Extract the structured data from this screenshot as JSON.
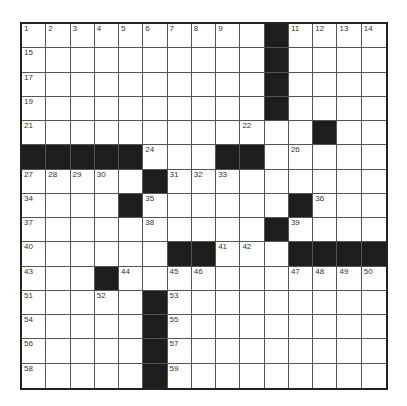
{
  "puzzle": {
    "rows": 15,
    "cols": 15,
    "colors": {
      "black": "#1e1e1e",
      "white": "#ffffff",
      "line": "#555555"
    },
    "grid": [
      "..........#....",
      "..........#....",
      "..........#....",
      "..........#....",
      "............#..",
      "#####...##.....",
      ".....#.........",
      "....#......#...",
      "..........#....",
      "......##...####",
      "...#...........",
      ".....#.........",
      ".....#.........",
      ".....#.........",
      ".....#........."
    ],
    "numbers": [
      {
        "r": 0,
        "c": 0,
        "n": "1"
      },
      {
        "r": 0,
        "c": 1,
        "n": "2"
      },
      {
        "r": 0,
        "c": 2,
        "n": "3"
      },
      {
        "r": 0,
        "c": 3,
        "n": "4"
      },
      {
        "r": 0,
        "c": 4,
        "n": "5"
      },
      {
        "r": 0,
        "c": 5,
        "n": "6"
      },
      {
        "r": 0,
        "c": 6,
        "n": "7"
      },
      {
        "r": 0,
        "c": 7,
        "n": "8"
      },
      {
        "r": 0,
        "c": 8,
        "n": "9"
      },
      {
        "r": 0,
        "c": 10,
        "n": "10"
      },
      {
        "r": 0,
        "c": 11,
        "n": "11"
      },
      {
        "r": 0,
        "c": 12,
        "n": "12"
      },
      {
        "r": 0,
        "c": 13,
        "n": "13"
      },
      {
        "r": 0,
        "c": 14,
        "n": "14"
      },
      {
        "r": 1,
        "c": 0,
        "n": "15"
      },
      {
        "r": 1,
        "c": 10,
        "n": "16"
      },
      {
        "r": 2,
        "c": 0,
        "n": "17"
      },
      {
        "r": 2,
        "c": 10,
        "n": "18"
      },
      {
        "r": 3,
        "c": 0,
        "n": "19"
      },
      {
        "r": 3,
        "c": 10,
        "n": "20"
      },
      {
        "r": 4,
        "c": 0,
        "n": "21"
      },
      {
        "r": 4,
        "c": 9,
        "n": "22"
      },
      {
        "r": 4,
        "c": 12,
        "n": "23"
      },
      {
        "r": 5,
        "c": 5,
        "n": "24"
      },
      {
        "r": 5,
        "c": 9,
        "n": "25"
      },
      {
        "r": 5,
        "c": 11,
        "n": "26"
      },
      {
        "r": 6,
        "c": 0,
        "n": "27"
      },
      {
        "r": 6,
        "c": 1,
        "n": "28"
      },
      {
        "r": 6,
        "c": 2,
        "n": "29"
      },
      {
        "r": 6,
        "c": 3,
        "n": "30"
      },
      {
        "r": 6,
        "c": 6,
        "n": "31"
      },
      {
        "r": 6,
        "c": 7,
        "n": "32"
      },
      {
        "r": 6,
        "c": 8,
        "n": "33"
      },
      {
        "r": 7,
        "c": 0,
        "n": "34"
      },
      {
        "r": 7,
        "c": 5,
        "n": "35"
      },
      {
        "r": 7,
        "c": 12,
        "n": "36"
      },
      {
        "r": 8,
        "c": 0,
        "n": "37"
      },
      {
        "r": 8,
        "c": 5,
        "n": "38"
      },
      {
        "r": 8,
        "c": 11,
        "n": "39"
      },
      {
        "r": 9,
        "c": 0,
        "n": "40"
      },
      {
        "r": 9,
        "c": 8,
        "n": "41"
      },
      {
        "r": 9,
        "c": 9,
        "n": "42"
      },
      {
        "r": 10,
        "c": 0,
        "n": "43"
      },
      {
        "r": 10,
        "c": 4,
        "n": "44"
      },
      {
        "r": 10,
        "c": 6,
        "n": "45"
      },
      {
        "r": 10,
        "c": 7,
        "n": "46"
      },
      {
        "r": 10,
        "c": 11,
        "n": "47"
      },
      {
        "r": 10,
        "c": 12,
        "n": "48"
      },
      {
        "r": 10,
        "c": 13,
        "n": "49"
      },
      {
        "r": 10,
        "c": 14,
        "n": "50"
      },
      {
        "r": 11,
        "c": 0,
        "n": "51"
      },
      {
        "r": 11,
        "c": 3,
        "n": "52"
      },
      {
        "r": 11,
        "c": 6,
        "n": "53"
      },
      {
        "r": 12,
        "c": 0,
        "n": "54"
      },
      {
        "r": 12,
        "c": 6,
        "n": "55"
      },
      {
        "r": 13,
        "c": 0,
        "n": "56"
      },
      {
        "r": 13,
        "c": 6,
        "n": "57"
      },
      {
        "r": 14,
        "c": 0,
        "n": "58"
      },
      {
        "r": 14,
        "c": 6,
        "n": "59"
      }
    ]
  }
}
